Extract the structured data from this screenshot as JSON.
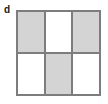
{
  "figure": {
    "panel_label": "d",
    "colors": {
      "background": "#ffffff",
      "grid_line": "#7d7d7d",
      "filled_cell": "#d4d4d4",
      "empty_cell": "#ffffff",
      "label_text": "#1a1a1a"
    },
    "grid": {
      "columns": 3,
      "rows": 2,
      "border_width_px": 2,
      "line_width_px": 2,
      "cells": [
        {
          "row": 0,
          "col": 0,
          "state": "filled"
        },
        {
          "row": 0,
          "col": 1,
          "state": "empty"
        },
        {
          "row": 0,
          "col": 2,
          "state": "filled"
        },
        {
          "row": 1,
          "col": 0,
          "state": "empty"
        },
        {
          "row": 1,
          "col": 1,
          "state": "filled"
        },
        {
          "row": 1,
          "col": 2,
          "state": "empty"
        }
      ]
    }
  }
}
